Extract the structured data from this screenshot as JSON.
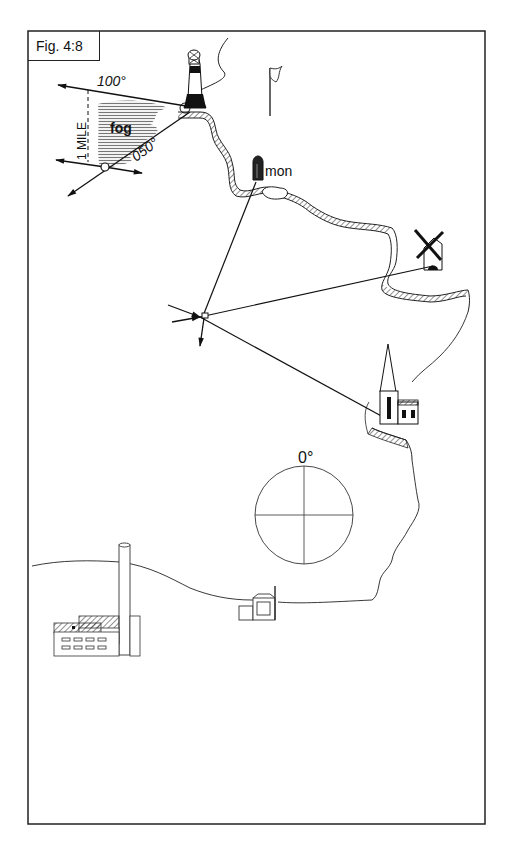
{
  "figure": {
    "label": "Fig. 4:8",
    "frame_color": "#222222",
    "ink_color": "#111111"
  },
  "labels": {
    "bearing_lighthouse": "100°",
    "bearing_run": "050°",
    "distance": "1 MILE",
    "fog": "fog",
    "monument": "mon",
    "compass_north": "0°"
  },
  "landmarks": [
    {
      "name": "lighthouse"
    },
    {
      "name": "flagstaff"
    },
    {
      "name": "monument"
    },
    {
      "name": "windmill"
    },
    {
      "name": "church"
    },
    {
      "name": "hut"
    },
    {
      "name": "factory-chimney"
    }
  ],
  "compass": {
    "north_label": "0°"
  }
}
